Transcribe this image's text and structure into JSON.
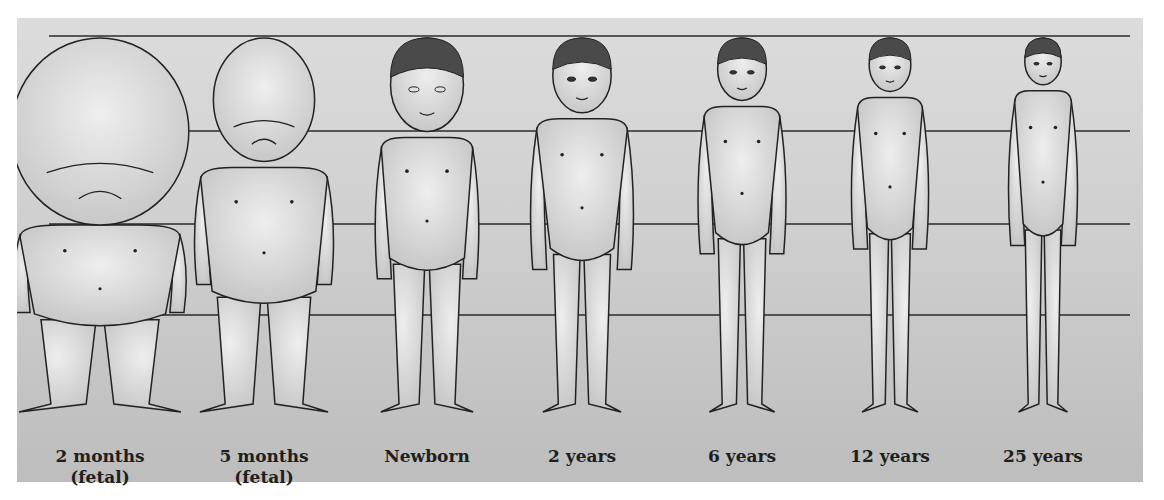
{
  "colors": {
    "panel_top": "#dcdcdc",
    "panel_bottom": "#bdbdbd",
    "line": "#2a2a2a",
    "skin": "#d6d6d6",
    "skin_highlight": "#ececec",
    "hair": "#4a4a4a",
    "outline": "#222222"
  },
  "reference_lines_y": [
    36,
    131,
    224,
    315
  ],
  "figures": [
    {
      "id": "2-months",
      "label_line1": "2 months",
      "label_line2": "(fetal)",
      "cx": 100,
      "head_ratio": 0.5
    },
    {
      "id": "5-months",
      "label_line1": "5 months",
      "label_line2": "(fetal)",
      "cx": 264,
      "head_ratio": 0.33
    },
    {
      "id": "newborn",
      "label_line1": "Newborn",
      "label_line2": "",
      "cx": 427,
      "head_ratio": 0.25
    },
    {
      "id": "2-years",
      "label_line1": "2 years",
      "label_line2": "",
      "cx": 582,
      "head_ratio": 0.2
    },
    {
      "id": "6-years",
      "label_line1": "6 years",
      "label_line2": "",
      "cx": 742,
      "head_ratio": 0.167
    },
    {
      "id": "12-years",
      "label_line1": "12  years",
      "label_line2": "",
      "cx": 890,
      "head_ratio": 0.143
    },
    {
      "id": "25-years",
      "label_line1": "25  years",
      "label_line2": "",
      "cx": 1043,
      "head_ratio": 0.125
    }
  ]
}
